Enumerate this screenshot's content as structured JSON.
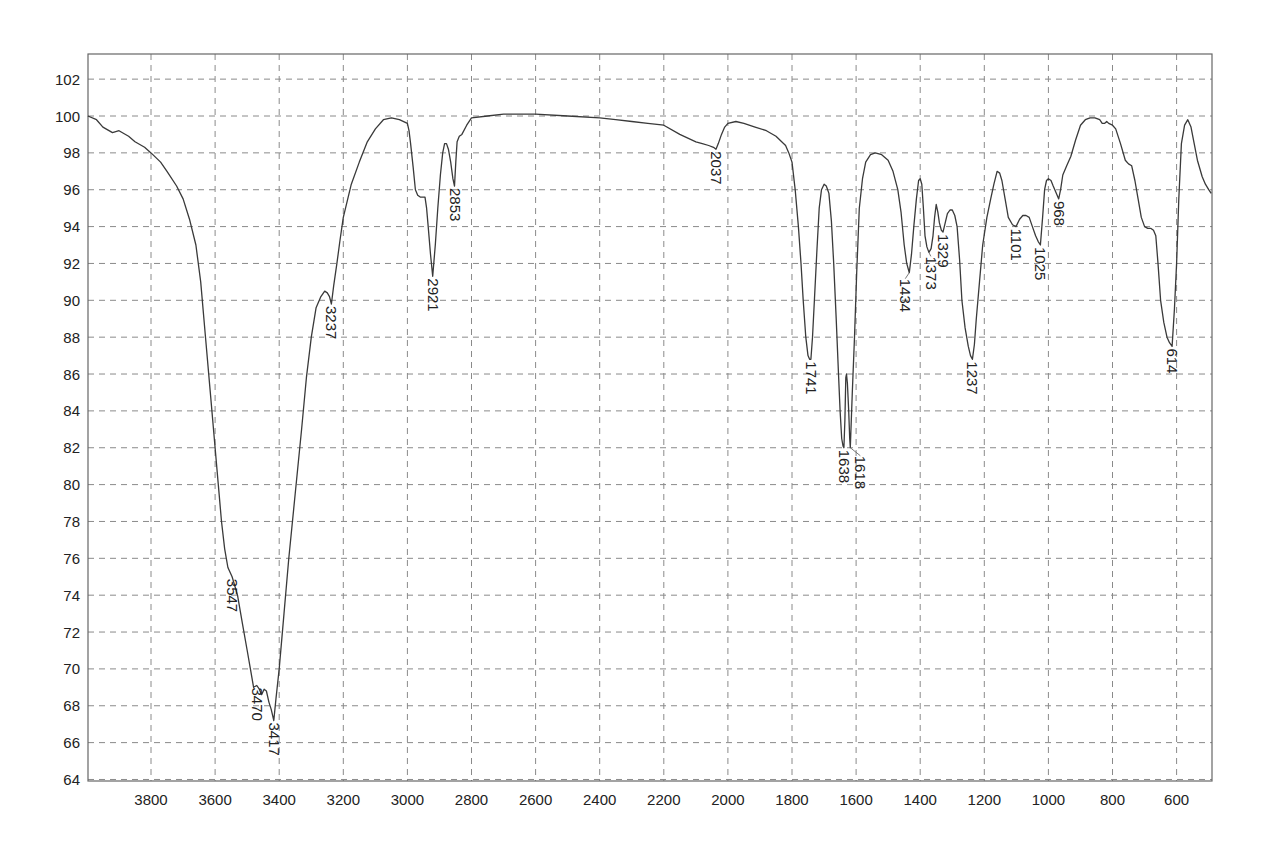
{
  "chart_data": {
    "type": "line",
    "title": "",
    "xlabel": "",
    "ylabel": "",
    "xlim": [
      3997,
      490
    ],
    "ylim": [
      64,
      103.3
    ],
    "x_reversed": true,
    "grid": true,
    "legend": null,
    "x_ticks": [
      3800,
      3600,
      3400,
      3200,
      3000,
      2800,
      2600,
      2400,
      2200,
      2000,
      1800,
      1600,
      1400,
      1200,
      1000,
      800,
      600
    ],
    "y_ticks": [
      64,
      66,
      68,
      70,
      72,
      74,
      76,
      78,
      80,
      82,
      84,
      86,
      88,
      90,
      92,
      94,
      96,
      98,
      100,
      102
    ],
    "series": [
      {
        "name": "IR spectrum (%T)",
        "color": "#3a3a3a",
        "points": [
          [
            3997,
            100.0
          ],
          [
            3970,
            99.8
          ],
          [
            3950,
            99.4
          ],
          [
            3920,
            99.1
          ],
          [
            3900,
            99.2
          ],
          [
            3870,
            98.9
          ],
          [
            3850,
            98.6
          ],
          [
            3820,
            98.3
          ],
          [
            3800,
            98.0
          ],
          [
            3770,
            97.5
          ],
          [
            3750,
            97.0
          ],
          [
            3720,
            96.2
          ],
          [
            3700,
            95.5
          ],
          [
            3680,
            94.4
          ],
          [
            3660,
            93.0
          ],
          [
            3645,
            91.0
          ],
          [
            3630,
            88.0
          ],
          [
            3615,
            85.0
          ],
          [
            3600,
            82.0
          ],
          [
            3590,
            80.0
          ],
          [
            3580,
            78.0
          ],
          [
            3570,
            76.5
          ],
          [
            3560,
            75.5
          ],
          [
            3547,
            75.0
          ],
          [
            3540,
            74.6
          ],
          [
            3530,
            74.0
          ],
          [
            3515,
            72.5
          ],
          [
            3500,
            71.0
          ],
          [
            3490,
            70.0
          ],
          [
            3480,
            69.0
          ],
          [
            3470,
            69.1
          ],
          [
            3462,
            68.9
          ],
          [
            3455,
            68.6
          ],
          [
            3447,
            68.9
          ],
          [
            3440,
            68.8
          ],
          [
            3432,
            68.2
          ],
          [
            3425,
            67.8
          ],
          [
            3417,
            67.2
          ],
          [
            3410,
            68.4
          ],
          [
            3400,
            70.0
          ],
          [
            3385,
            73.0
          ],
          [
            3370,
            76.0
          ],
          [
            3350,
            79.5
          ],
          [
            3330,
            83.0
          ],
          [
            3315,
            85.8
          ],
          [
            3300,
            88.0
          ],
          [
            3285,
            89.6
          ],
          [
            3270,
            90.2
          ],
          [
            3258,
            90.5
          ],
          [
            3250,
            90.4
          ],
          [
            3243,
            90.2
          ],
          [
            3237,
            89.8
          ],
          [
            3230,
            90.8
          ],
          [
            3220,
            92.0
          ],
          [
            3210,
            93.3
          ],
          [
            3200,
            94.5
          ],
          [
            3175,
            96.3
          ],
          [
            3150,
            97.5
          ],
          [
            3125,
            98.6
          ],
          [
            3100,
            99.3
          ],
          [
            3075,
            99.8
          ],
          [
            3050,
            99.9
          ],
          [
            3025,
            99.8
          ],
          [
            3000,
            99.6
          ],
          [
            2995,
            99.2
          ],
          [
            2990,
            98.5
          ],
          [
            2982,
            97.2
          ],
          [
            2975,
            96.0
          ],
          [
            2968,
            95.7
          ],
          [
            2960,
            95.6
          ],
          [
            2952,
            95.6
          ],
          [
            2945,
            95.6
          ],
          [
            2940,
            95.0
          ],
          [
            2935,
            94.0
          ],
          [
            2928,
            92.5
          ],
          [
            2921,
            91.3
          ],
          [
            2913,
            93.0
          ],
          [
            2905,
            95.0
          ],
          [
            2897,
            96.8
          ],
          [
            2890,
            98.0
          ],
          [
            2884,
            98.5
          ],
          [
            2878,
            98.5
          ],
          [
            2872,
            98.2
          ],
          [
            2865,
            97.5
          ],
          [
            2858,
            96.6
          ],
          [
            2853,
            96.2
          ],
          [
            2849,
            97.5
          ],
          [
            2845,
            98.6
          ],
          [
            2838,
            98.9
          ],
          [
            2830,
            99.0
          ],
          [
            2815,
            99.5
          ],
          [
            2800,
            99.9
          ],
          [
            2750,
            100.0
          ],
          [
            2700,
            100.1
          ],
          [
            2650,
            100.1
          ],
          [
            2600,
            100.1
          ],
          [
            2500,
            100.0
          ],
          [
            2400,
            99.9
          ],
          [
            2350,
            99.8
          ],
          [
            2300,
            99.7
          ],
          [
            2250,
            99.6
          ],
          [
            2200,
            99.5
          ],
          [
            2150,
            99.0
          ],
          [
            2100,
            98.6
          ],
          [
            2080,
            98.5
          ],
          [
            2060,
            98.4
          ],
          [
            2045,
            98.3
          ],
          [
            2037,
            98.2
          ],
          [
            2030,
            98.5
          ],
          [
            2020,
            99.0
          ],
          [
            2010,
            99.4
          ],
          [
            2000,
            99.6
          ],
          [
            1975,
            99.7
          ],
          [
            1950,
            99.6
          ],
          [
            1915,
            99.4
          ],
          [
            1880,
            99.2
          ],
          [
            1850,
            98.9
          ],
          [
            1820,
            98.4
          ],
          [
            1810,
            98.0
          ],
          [
            1800,
            97.5
          ],
          [
            1790,
            96.0
          ],
          [
            1780,
            94.0
          ],
          [
            1772,
            92.0
          ],
          [
            1765,
            90.0
          ],
          [
            1757,
            88.0
          ],
          [
            1750,
            87.0
          ],
          [
            1745,
            86.8
          ],
          [
            1741,
            86.8
          ],
          [
            1736,
            88.0
          ],
          [
            1730,
            90.0
          ],
          [
            1722,
            92.8
          ],
          [
            1715,
            95.0
          ],
          [
            1708,
            96.0
          ],
          [
            1700,
            96.3
          ],
          [
            1693,
            96.2
          ],
          [
            1685,
            95.8
          ],
          [
            1677,
            94.3
          ],
          [
            1670,
            92.0
          ],
          [
            1662,
            89.0
          ],
          [
            1655,
            86.0
          ],
          [
            1650,
            84.0
          ],
          [
            1645,
            82.5
          ],
          [
            1641,
            82.1
          ],
          [
            1638,
            82.0
          ],
          [
            1635,
            83.5
          ],
          [
            1632,
            85.8
          ],
          [
            1630,
            86.0
          ],
          [
            1627,
            85.5
          ],
          [
            1623,
            84.0
          ],
          [
            1620,
            82.5
          ],
          [
            1618,
            82.0
          ],
          [
            1612,
            85.0
          ],
          [
            1605,
            88.0
          ],
          [
            1598,
            91.5
          ],
          [
            1590,
            95.0
          ],
          [
            1580,
            96.6
          ],
          [
            1570,
            97.5
          ],
          [
            1555,
            97.9
          ],
          [
            1540,
            98.0
          ],
          [
            1520,
            97.9
          ],
          [
            1500,
            97.6
          ],
          [
            1485,
            97.0
          ],
          [
            1470,
            96.0
          ],
          [
            1460,
            94.8
          ],
          [
            1450,
            93.0
          ],
          [
            1442,
            92.0
          ],
          [
            1434,
            91.5
          ],
          [
            1427,
            92.5
          ],
          [
            1420,
            94.0
          ],
          [
            1412,
            95.5
          ],
          [
            1405,
            96.5
          ],
          [
            1400,
            96.6
          ],
          [
            1395,
            96.3
          ],
          [
            1390,
            95.0
          ],
          [
            1385,
            93.5
          ],
          [
            1379,
            92.9
          ],
          [
            1373,
            92.6
          ],
          [
            1366,
            92.8
          ],
          [
            1360,
            93.5
          ],
          [
            1355,
            94.5
          ],
          [
            1350,
            95.2
          ],
          [
            1345,
            94.8
          ],
          [
            1340,
            94.2
          ],
          [
            1334,
            93.8
          ],
          [
            1329,
            93.7
          ],
          [
            1322,
            94.2
          ],
          [
            1315,
            94.7
          ],
          [
            1307,
            94.9
          ],
          [
            1300,
            94.9
          ],
          [
            1292,
            94.6
          ],
          [
            1285,
            94.0
          ],
          [
            1277,
            92.2
          ],
          [
            1270,
            90.0
          ],
          [
            1260,
            88.5
          ],
          [
            1250,
            87.5
          ],
          [
            1243,
            87.0
          ],
          [
            1237,
            86.8
          ],
          [
            1231,
            87.6
          ],
          [
            1225,
            89.0
          ],
          [
            1215,
            91.0
          ],
          [
            1205,
            93.0
          ],
          [
            1192,
            94.5
          ],
          [
            1180,
            95.5
          ],
          [
            1170,
            96.3
          ],
          [
            1160,
            97.0
          ],
          [
            1152,
            96.9
          ],
          [
            1145,
            96.5
          ],
          [
            1135,
            95.5
          ],
          [
            1125,
            94.5
          ],
          [
            1112,
            94.1
          ],
          [
            1101,
            94.0
          ],
          [
            1090,
            94.4
          ],
          [
            1080,
            94.6
          ],
          [
            1070,
            94.6
          ],
          [
            1060,
            94.5
          ],
          [
            1050,
            94.0
          ],
          [
            1040,
            93.5
          ],
          [
            1032,
            93.2
          ],
          [
            1025,
            93.0
          ],
          [
            1018,
            94.5
          ],
          [
            1012,
            96.0
          ],
          [
            1006,
            96.5
          ],
          [
            1000,
            96.6
          ],
          [
            992,
            96.5
          ],
          [
            985,
            96.2
          ],
          [
            975,
            95.8
          ],
          [
            968,
            95.5
          ],
          [
            962,
            96.0
          ],
          [
            955,
            96.8
          ],
          [
            943,
            97.3
          ],
          [
            930,
            97.8
          ],
          [
            915,
            98.7
          ],
          [
            900,
            99.5
          ],
          [
            885,
            99.8
          ],
          [
            870,
            99.9
          ],
          [
            855,
            99.9
          ],
          [
            840,
            99.8
          ],
          [
            832,
            99.6
          ],
          [
            825,
            99.6
          ],
          [
            818,
            99.7
          ],
          [
            812,
            99.6
          ],
          [
            800,
            99.5
          ],
          [
            790,
            99.3
          ],
          [
            775,
            98.5
          ],
          [
            760,
            97.6
          ],
          [
            750,
            97.4
          ],
          [
            740,
            97.3
          ],
          [
            730,
            96.5
          ],
          [
            720,
            95.5
          ],
          [
            710,
            94.5
          ],
          [
            700,
            94.0
          ],
          [
            690,
            93.9
          ],
          [
            680,
            93.9
          ],
          [
            672,
            93.8
          ],
          [
            665,
            93.5
          ],
          [
            658,
            92.0
          ],
          [
            650,
            90.0
          ],
          [
            640,
            88.8
          ],
          [
            630,
            88.0
          ],
          [
            622,
            87.7
          ],
          [
            614,
            87.5
          ],
          [
            607,
            89.5
          ],
          [
            600,
            92.0
          ],
          [
            593,
            95.5
          ],
          [
            585,
            98.5
          ],
          [
            575,
            99.5
          ],
          [
            565,
            99.8
          ],
          [
            555,
            99.4
          ],
          [
            545,
            98.5
          ],
          [
            535,
            97.6
          ],
          [
            520,
            96.7
          ],
          [
            510,
            96.3
          ],
          [
            500,
            96.0
          ],
          [
            492,
            95.8
          ]
        ]
      }
    ],
    "annotations": [
      {
        "label": "3547",
        "x": 3547,
        "y": 75.0
      },
      {
        "label": "3470",
        "x": 3470,
        "y": 69.1
      },
      {
        "label": "3417",
        "x": 3417,
        "y": 67.2
      },
      {
        "label": "3237",
        "x": 3237,
        "y": 89.8
      },
      {
        "label": "2921",
        "x": 2921,
        "y": 91.3
      },
      {
        "label": "2853",
        "x": 2853,
        "y": 96.2
      },
      {
        "label": "2037",
        "x": 2037,
        "y": 98.2
      },
      {
        "label": "1741",
        "x": 1741,
        "y": 86.8
      },
      {
        "label": "1638",
        "x": 1638,
        "y": 82.0
      },
      {
        "label": "1618",
        "x": 1618,
        "y": 82.0
      },
      {
        "label": "1434",
        "x": 1434,
        "y": 91.5
      },
      {
        "label": "1373",
        "x": 1373,
        "y": 92.6
      },
      {
        "label": "1329",
        "x": 1329,
        "y": 93.7
      },
      {
        "label": "1237",
        "x": 1237,
        "y": 86.8
      },
      {
        "label": "1101",
        "x": 1101,
        "y": 94.0
      },
      {
        "label": "1025",
        "x": 1025,
        "y": 93.0
      },
      {
        "label": "968",
        "x": 968,
        "y": 95.5
      },
      {
        "label": "614",
        "x": 614,
        "y": 87.5
      }
    ]
  }
}
